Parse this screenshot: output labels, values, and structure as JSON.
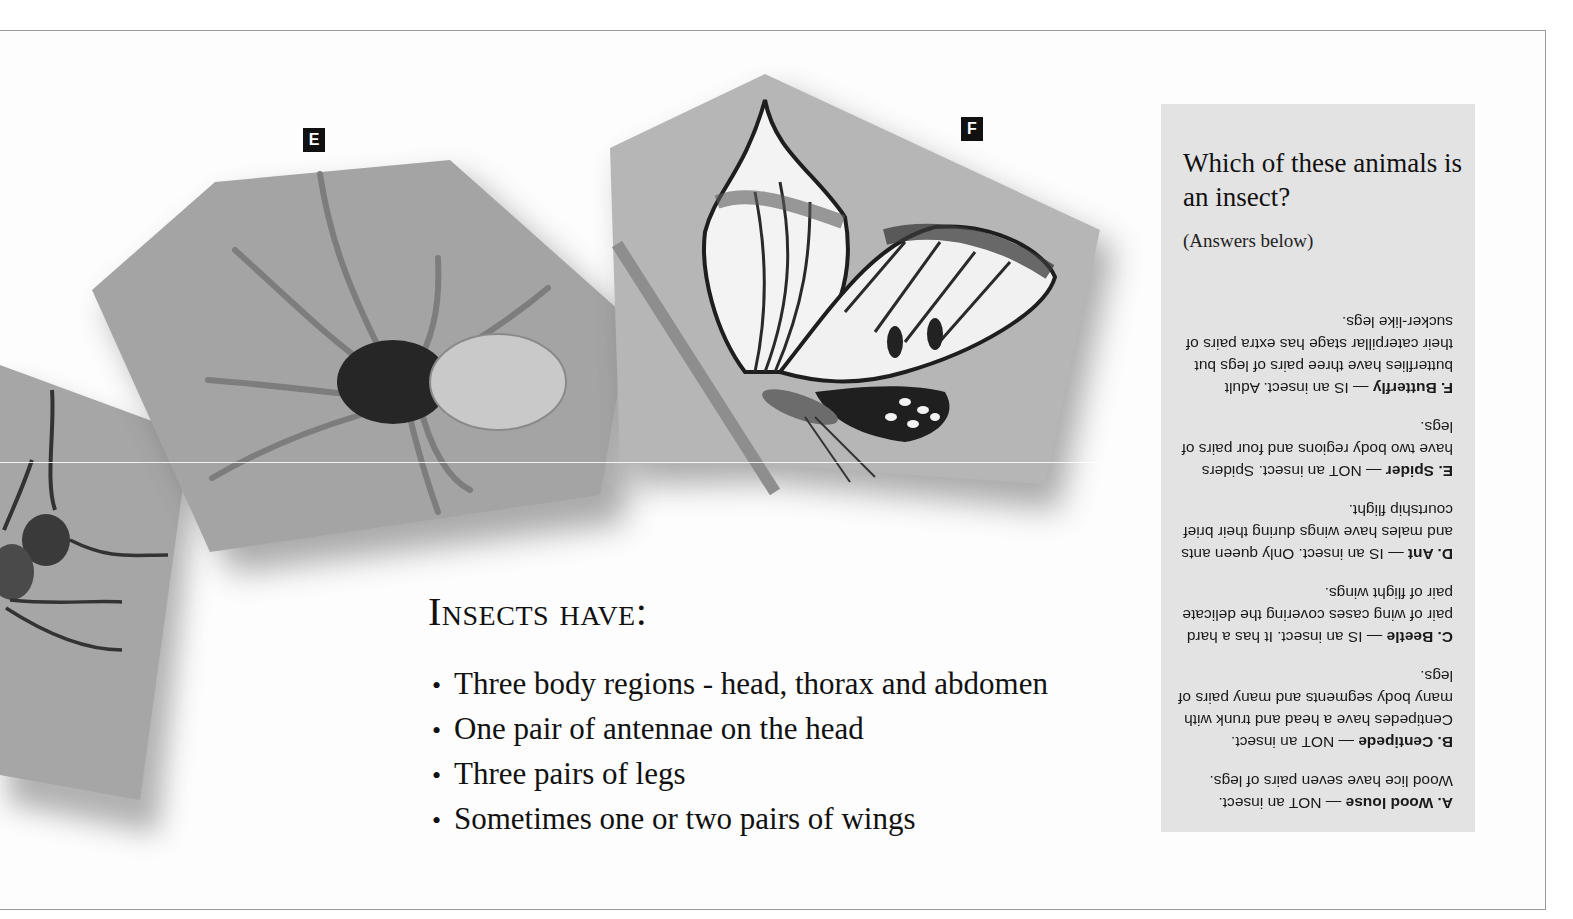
{
  "page": {
    "labels": {
      "spider": "E",
      "butterfly": "F"
    }
  },
  "images": {
    "ant": "ant-photo",
    "spider": "spider-photo",
    "butterfly": "butterfly-illustration"
  },
  "insects_have": {
    "heading": "Insects have:",
    "bullet": "•",
    "items": [
      "Three body regions - head, thorax and abdomen",
      "One pair of antennae on the head",
      "Three pairs of legs",
      "Sometimes one or two pairs of wings"
    ]
  },
  "quiz": {
    "title": "Which of these animals is an insect?",
    "subtitle": "(Answers below)",
    "answers": [
      {
        "name": "A. Wood louse",
        "text": " — NOT an insect. Wood lice have seven pairs of legs."
      },
      {
        "name": "B. Centipede",
        "text": " — NOT an insect. Centipedes have a head and trunk with many body segments and many pairs of legs."
      },
      {
        "name": "C. Beetle",
        "text": " — IS an insect. It has a hard pair of wing cases covering the delicate pair of flight wings."
      },
      {
        "name": "D. Ant",
        "text": " — IS an insect. Only queen ants and males have wings during their brief courtship flight."
      },
      {
        "name": "E. Spider",
        "text": " — NOT an insect. Spiders have two body regions and four pairs of legs."
      },
      {
        "name": "F. Butterfly",
        "text": " — IS an insect. Adult butterflies have three pairs of legs but their caterpillar stage has extra pairs of sucker-like legs."
      }
    ]
  },
  "colors": {
    "panel_gray": "#a9a9a9",
    "answer_box": "#e3e3e3",
    "text": "#111111"
  }
}
